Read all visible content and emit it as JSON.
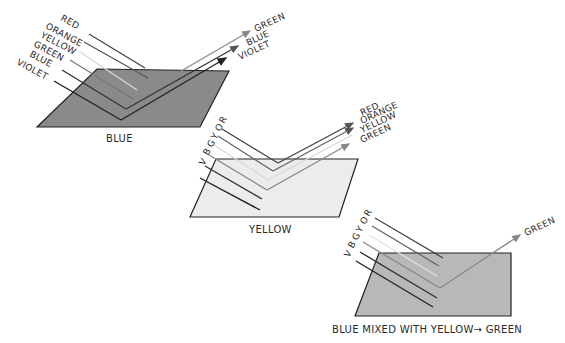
{
  "panels": [
    {
      "name": "blue-surface",
      "caption": "BLUE",
      "surface_color": "#8a8a8a",
      "incident_labels": [
        "RED",
        "ORANGE",
        "YELLOW",
        "GREEN",
        "BLUE",
        "VIOLET"
      ],
      "reflected_labels": [
        "GREEN",
        "BLUE",
        "VIOLET"
      ]
    },
    {
      "name": "yellow-surface",
      "caption": "YELLOW",
      "surface_color": "#ececec",
      "incident_labels": [
        "V",
        "B",
        "G",
        "Y",
        "O",
        "R"
      ],
      "reflected_labels": [
        "RED",
        "ORANGE",
        "YELLOW",
        "GREEN"
      ]
    },
    {
      "name": "mixed-surface",
      "caption": "BLUE MIXED WITH YELLOW→ GREEN",
      "surface_color": "#b8b8b8",
      "incident_labels": [
        "V",
        "B",
        "G",
        "Y",
        "O",
        "R"
      ],
      "reflected_labels": [
        "GREEN"
      ]
    }
  ]
}
